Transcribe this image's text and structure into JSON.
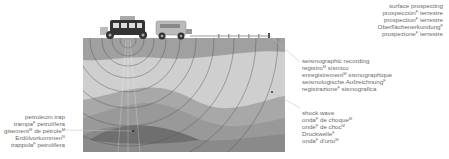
{
  "labels": {
    "surface_prospecting": {
      "lines": [
        {
          "text": "surface prospecting",
          "sup": ""
        },
        {
          "text": "prospección",
          "sup": "F",
          "rest": " terrestre"
        },
        {
          "text": "prospection",
          "sup": "F",
          "rest": " terrestre"
        },
        {
          "text": "Oberflächenerkundung",
          "sup": "F",
          "rest": ""
        },
        {
          "text": "prospezione",
          "sup": "F",
          "rest": " terrestre"
        }
      ]
    },
    "seismographic_recording": {
      "lines": [
        {
          "text": "seismographic recording",
          "sup": ""
        },
        {
          "text": "registro",
          "sup": "M",
          "rest": " sísmico"
        },
        {
          "text": "enregistrement",
          "sup": "M",
          "rest": " sismographique"
        },
        {
          "text": "seismologische Aufzeichnung",
          "sup": "F",
          "rest": ""
        },
        {
          "text": "registrazione",
          "sup": "F",
          "rest": " sismografica"
        }
      ]
    },
    "shock_wave": {
      "lines": [
        {
          "text": "shock wave",
          "sup": ""
        },
        {
          "text": "onda",
          "sup": "F",
          "rest": " de choque",
          "sup2": "M"
        },
        {
          "text": "onde",
          "sup": "F",
          "rest": " de choc",
          "sup2": "M"
        },
        {
          "text": "Druckwelle",
          "sup": "F",
          "rest": ""
        },
        {
          "text": "onda",
          "sup": "F",
          "rest": " d'urto",
          "sup2": "M"
        }
      ]
    },
    "petroleum_trap": {
      "lines": [
        {
          "text": "petroleum trap",
          "sup": ""
        },
        {
          "text": "trampa",
          "sup": "F",
          "rest": " petrolífera"
        },
        {
          "text": "gisement",
          "sup": "M",
          "rest": " de pétrole",
          "sup2": "M"
        },
        {
          "text": "Erdölvorkommen",
          "sup": "N",
          "rest": ""
        },
        {
          "text": "trappola",
          "sup": "F",
          "rest": " petrolifera"
        }
      ]
    }
  },
  "colors": {
    "layer_top": "#9c9c9c",
    "layer_light": "#cfcfcf",
    "layer_mid": "#a8a8a8",
    "layer_dark": "#8a8a8a",
    "layer_trap": "#6f6f6f",
    "wave": "#555555",
    "leader": "#bbbbbb"
  }
}
